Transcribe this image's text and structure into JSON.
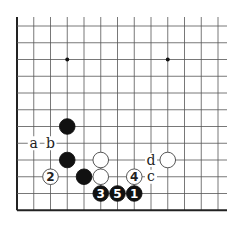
{
  "diagram": {
    "type": "go-board-fragment",
    "grid": {
      "origin_x": 17,
      "origin_y": 26,
      "spacing": 16.75,
      "columns": 13,
      "rows": 12,
      "top_stub_y": 17,
      "right_extent_x": 227,
      "edges": {
        "left": true,
        "bottom": true,
        "top": false,
        "right": false
      },
      "line_color": "#555555",
      "edge_color": "#222222"
    },
    "star_points": [
      {
        "col": 3,
        "row": 2
      },
      {
        "col": 9,
        "row": 2
      }
    ],
    "stones": [
      {
        "color": "black",
        "col": 3,
        "row": 6,
        "label": ""
      },
      {
        "color": "black",
        "col": 3,
        "row": 8,
        "label": ""
      },
      {
        "color": "black",
        "col": 4,
        "row": 9,
        "label": ""
      },
      {
        "color": "white",
        "col": 5,
        "row": 8,
        "label": ""
      },
      {
        "color": "white",
        "col": 5,
        "row": 9,
        "label": ""
      },
      {
        "color": "white",
        "col": 9,
        "row": 8,
        "label": ""
      },
      {
        "color": "black",
        "col": 7,
        "row": 10,
        "label": "1"
      },
      {
        "color": "white",
        "col": 2,
        "row": 9,
        "label": "2"
      },
      {
        "color": "black",
        "col": 5,
        "row": 10,
        "label": "3"
      },
      {
        "color": "white",
        "col": 7,
        "row": 9,
        "label": "4"
      },
      {
        "color": "black",
        "col": 6,
        "row": 10,
        "label": "5"
      }
    ],
    "marks": [
      {
        "col": 1,
        "row": 7,
        "label": "a"
      },
      {
        "col": 2,
        "row": 7,
        "label": "b"
      },
      {
        "col": 8,
        "row": 9,
        "label": "c"
      },
      {
        "col": 8,
        "row": 8,
        "label": "d"
      }
    ]
  }
}
